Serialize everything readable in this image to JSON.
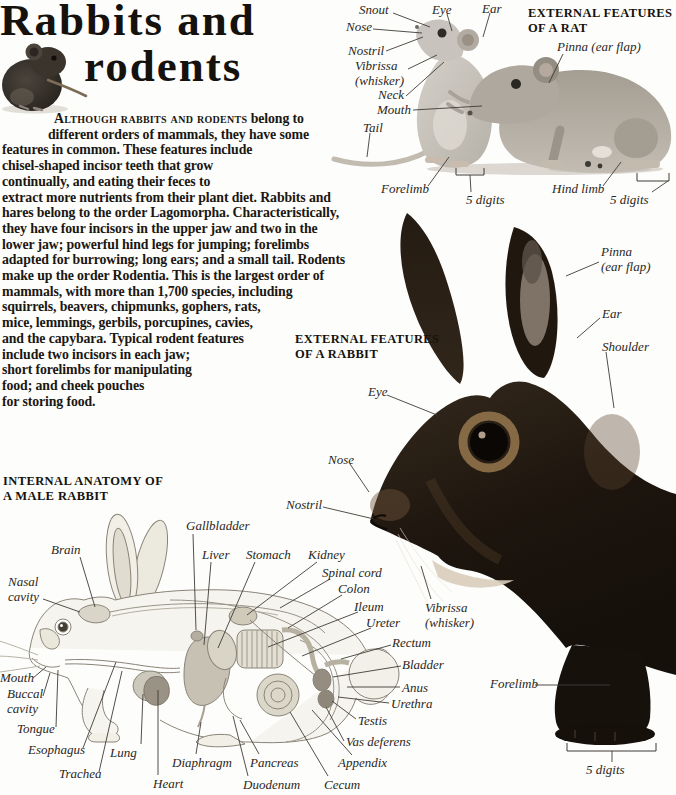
{
  "colors": {
    "page_bg": "#fdfdfb",
    "title_text": "#15120e",
    "body_text": "#1a1712",
    "label_text": "#2b2722",
    "heading_text": "#15120e",
    "leader_line": "#3f3b35"
  },
  "masthead": {
    "title_line1": "Rabbits and",
    "title_line2": "rodents"
  },
  "intro": {
    "lead_smallcaps": "Although rabbits and rodents",
    "lines": [
      "belong to",
      "different orders of mammals, they have some",
      "features in common. These features include",
      "chisel-shaped incisor teeth that grow",
      "continually, and eating their feces to",
      "extract more nutrients from their plant diet. Rabbits and",
      "hares belong to the order Lagomorpha. Characteristically,",
      "they have four incisors in the upper jaw and two in the",
      "lower jaw; powerful hind legs for jumping; forelimbs",
      "adapted for burrowing; long ears; and a small tail. Rodents",
      "make up the order Rodentia. This is the largest order of",
      "mammals, with more than 1,700 species, including",
      "squirrels, beavers, chipmunks, gophers, rats,",
      "mice, lemmings, gerbils, porcupines, cavies,",
      "and the capybara. Typical rodent features",
      "include two incisors in each jaw;",
      "short forelimbs for manipulating",
      "food; and cheek pouches",
      "for storing food."
    ]
  },
  "sections": {
    "rat": {
      "heading_line1": "EXTERNAL FEATURES",
      "heading_line2": "OF A RAT",
      "labels": [
        {
          "id": "snout",
          "text": "Snout"
        },
        {
          "id": "eye",
          "text": "Eye"
        },
        {
          "id": "ear",
          "text": "Ear"
        },
        {
          "id": "nose",
          "text": "Nose"
        },
        {
          "id": "nostril",
          "text": "Nostril"
        },
        {
          "id": "vibrissa",
          "text": "Vibrissa\n(whisker)"
        },
        {
          "id": "neck",
          "text": "Neck"
        },
        {
          "id": "mouth",
          "text": "Mouth"
        },
        {
          "id": "tail",
          "text": "Tail"
        },
        {
          "id": "pinna",
          "text": "Pinna (ear flap)"
        },
        {
          "id": "forelimb",
          "text": "Forelimb"
        },
        {
          "id": "digits-front",
          "text": "5 digits"
        },
        {
          "id": "hindlimb",
          "text": "Hind limb"
        },
        {
          "id": "digits-hind",
          "text": "5 digits"
        }
      ]
    },
    "rabbit": {
      "heading_line1": "EXTERNAL FEATURES",
      "heading_line2": "OF A RABBIT",
      "labels": [
        {
          "id": "pinna",
          "text": "Pinna\n(ear flap)"
        },
        {
          "id": "ear",
          "text": "Ear"
        },
        {
          "id": "shoulder",
          "text": "Shoulder"
        },
        {
          "id": "eye",
          "text": "Eye"
        },
        {
          "id": "nose",
          "text": "Nose"
        },
        {
          "id": "nostril",
          "text": "Nostril"
        },
        {
          "id": "vibrissa",
          "text": "Vibrissa\n(whisker)"
        },
        {
          "id": "forelimb",
          "text": "Forelimb"
        },
        {
          "id": "digits",
          "text": "5 digits"
        }
      ]
    },
    "anatomy": {
      "heading_line1": "INTERNAL ANATOMY OF",
      "heading_line2": "A MALE RABBIT",
      "labels": [
        {
          "id": "brain",
          "text": "Brain"
        },
        {
          "id": "nasal-cavity",
          "text": "Nasal\ncavity"
        },
        {
          "id": "gallbladder",
          "text": "Gallbladder"
        },
        {
          "id": "liver",
          "text": "Liver"
        },
        {
          "id": "stomach",
          "text": "Stomach"
        },
        {
          "id": "kidney",
          "text": "Kidney"
        },
        {
          "id": "spinal-cord",
          "text": "Spinal cord"
        },
        {
          "id": "colon",
          "text": "Colon"
        },
        {
          "id": "ileum",
          "text": "Ileum"
        },
        {
          "id": "ureter",
          "text": "Ureter"
        },
        {
          "id": "rectum",
          "text": "Rectum"
        },
        {
          "id": "bladder",
          "text": "Bladder"
        },
        {
          "id": "anus",
          "text": "Anus"
        },
        {
          "id": "urethra",
          "text": "Urethra"
        },
        {
          "id": "mouth",
          "text": "Mouth"
        },
        {
          "id": "buccal-cavity",
          "text": "Buccal\ncavity"
        },
        {
          "id": "tongue",
          "text": "Tongue"
        },
        {
          "id": "esophagus",
          "text": "Esophagus"
        },
        {
          "id": "trachea",
          "text": "Trachea"
        },
        {
          "id": "lung",
          "text": "Lung"
        },
        {
          "id": "heart",
          "text": "Heart"
        },
        {
          "id": "diaphragm",
          "text": "Diaphragm"
        },
        {
          "id": "duodenum",
          "text": "Duodenum"
        },
        {
          "id": "pancreas",
          "text": "Pancreas"
        },
        {
          "id": "cecum",
          "text": "Cecum"
        },
        {
          "id": "appendix",
          "text": "Appendix"
        },
        {
          "id": "testis",
          "text": "Testis"
        },
        {
          "id": "vas-deferens",
          "text": "Vas deferens"
        }
      ]
    }
  }
}
